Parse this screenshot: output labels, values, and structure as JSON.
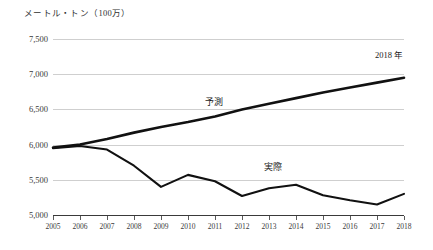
{
  "chart_data": {
    "type": "line",
    "title": "メートル・トン（100万）",
    "xlabel": "",
    "ylabel": "メートル・トン（100万）",
    "x": [
      2005,
      2006,
      2007,
      2008,
      2009,
      2010,
      2011,
      2012,
      2013,
      2014,
      2015,
      2016,
      2017,
      2018
    ],
    "categories": [
      "2005",
      "2006",
      "2007",
      "2008",
      "2009",
      "2010",
      "2011",
      "2012",
      "2013",
      "2014",
      "2015",
      "2016",
      "2017",
      "2018"
    ],
    "ylim": [
      5000,
      7500
    ],
    "yticks": [
      "7,500",
      "7,000",
      "6,500",
      "6,000",
      "5,500",
      "5,000"
    ],
    "ytick_values": [
      7500,
      7000,
      6500,
      6000,
      5500,
      5000
    ],
    "grid": true,
    "legend_position": "inline-annotation",
    "series": [
      {
        "name": "予測",
        "values": [
          5960,
          6000,
          6080,
          6170,
          6250,
          6320,
          6400,
          6500,
          6580,
          6660,
          6740,
          6810,
          6880,
          6950
        ]
      },
      {
        "name": "実際",
        "values": [
          5950,
          5980,
          5930,
          5700,
          5400,
          5570,
          5480,
          5270,
          5380,
          5430,
          5280,
          5210,
          5150,
          5300
        ]
      }
    ],
    "annotations": [
      {
        "name": "forecast-label",
        "text": "予測",
        "x": 2011,
        "y": 6620
      },
      {
        "name": "actual-label",
        "text": "実際",
        "x": 2013.2,
        "y": 5690
      },
      {
        "name": "year-label",
        "text": "2018 年",
        "x": 2017.3,
        "y": 7280
      }
    ]
  }
}
